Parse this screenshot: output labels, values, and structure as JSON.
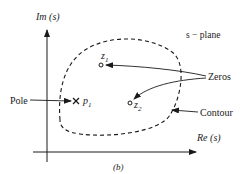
{
  "diagram": {
    "caption": "(b)",
    "plane_label": "s − plane",
    "axes": {
      "y_label": "Im (s)",
      "x_label": "Re (s)"
    },
    "points": {
      "zero1": {
        "label": "z",
        "subscript": "1",
        "symbol": "circle"
      },
      "zero2": {
        "label": "z",
        "subscript": "2",
        "symbol": "circle"
      },
      "pole1": {
        "label": "p",
        "subscript": "1",
        "symbol": "cross"
      }
    },
    "callouts": {
      "zeros": "Zeros",
      "pole": "Pole",
      "contour": "Contour"
    },
    "colors": {
      "ink": "#1a1a1a",
      "background": "#ffffff"
    }
  }
}
